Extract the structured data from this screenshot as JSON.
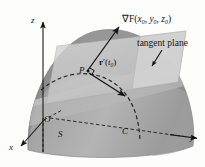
{
  "figure": {
    "background": "#fdfdfc"
  },
  "axes": {
    "z_label": "z",
    "y_label": "y",
    "x_label": "x",
    "origin_label": "O"
  },
  "labels": {
    "surface": "S",
    "curve": "C",
    "point": "P",
    "gradient_symbol": "∇F",
    "gradient_args_open": "(",
    "gradient_x": "x",
    "gradient_x_sub": "0",
    "gradient_comma1": ", ",
    "gradient_y": "y",
    "gradient_y_sub": "0",
    "gradient_comma2": ", ",
    "gradient_z": "z",
    "gradient_z_sub": "0",
    "gradient_args_close": ")",
    "tangent_plane": "tangent plane",
    "tangent_vector_bold": "r",
    "tangent_vector_prime": "′(",
    "tangent_vector_t": "t",
    "tangent_vector_sub": "0",
    "tangent_vector_close": ")"
  },
  "colors": {
    "surface_light": "#b9b9b9",
    "surface_mid": "#a0a0a0",
    "surface_dark": "#8a8a8a",
    "surface_band": "#8f8f8f",
    "plane_fill": "#c9c9c9",
    "plane_fill_light": "#d6d6d6",
    "axis_stroke": "#1a1a1a",
    "dashed_stroke": "#2b2b2b",
    "text": "#141414"
  },
  "elements": {
    "gradient_arrow": "arrow from P pointing up-right to gradient label",
    "tangent_arrow": "arrow from P pointing down-right along curve C",
    "right_angle": "right angle marker at P between gradient and tangent vector",
    "leader_arrow": "leader line from tangent plane label to plane surface"
  }
}
